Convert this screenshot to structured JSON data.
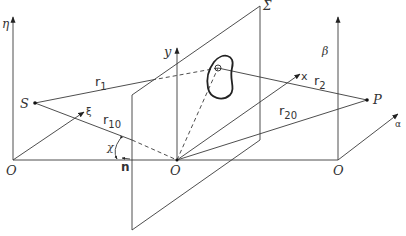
{
  "diagram": {
    "planes": {
      "aperture_plane": {
        "label": "Σ"
      }
    },
    "coordinate_frames": [
      {
        "name": "source-frame",
        "origin": "O",
        "axes": [
          "ξ",
          "η"
        ]
      },
      {
        "name": "aperture-frame",
        "origin": "O",
        "axes": [
          "x",
          "y"
        ]
      },
      {
        "name": "observation-frame",
        "origin": "O",
        "axes": [
          "α",
          "β"
        ]
      }
    ],
    "points": {
      "source": "S",
      "observation": "P"
    },
    "distances": {
      "r1": {
        "base": "r",
        "sub": "1"
      },
      "r2": {
        "base": "r",
        "sub": "2"
      },
      "r10": {
        "base": "r",
        "sub": "10"
      },
      "r20": {
        "base": "r",
        "sub": "20"
      }
    },
    "angle": {
      "label": "χ"
    },
    "normal": {
      "label": "n"
    },
    "labels": {
      "eta": "η",
      "xi": "ξ",
      "y": "y",
      "x": "x",
      "beta": "β",
      "alpha": "α",
      "sigma": "Σ",
      "S": "S",
      "P": "P",
      "O_left": "O",
      "O_center": "O",
      "O_right": "O",
      "chi": "χ",
      "n": "n"
    }
  }
}
